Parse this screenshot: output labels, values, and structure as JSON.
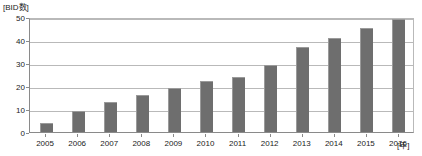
{
  "chart_data": {
    "type": "bar",
    "title": "",
    "subtitle": "",
    "xlabel": "[年]",
    "ylabel": "[BID数]",
    "categories": [
      "2005",
      "2006",
      "2007",
      "2008",
      "2009",
      "2010",
      "2011",
      "2012",
      "2013",
      "2014",
      "2015",
      "2016"
    ],
    "values": [
      4,
      9,
      13,
      16,
      19,
      22,
      24,
      29,
      37,
      41,
      45,
      49
    ],
    "series": [
      {
        "name": "BID数",
        "values": [
          4,
          9,
          13,
          16,
          19,
          22,
          24,
          29,
          37,
          41,
          45,
          49
        ]
      }
    ],
    "ylim": [
      0,
      50
    ],
    "yticks": [
      0,
      10,
      20,
      30,
      40,
      50
    ],
    "ytick_labels": [
      "0",
      "10",
      "20",
      "30",
      "40",
      "50"
    ],
    "grid": true,
    "grid_axis": "y",
    "legend": false,
    "legend_position": "none",
    "bar_color": "#6e6e6e",
    "grid_color": "#b9b9b9",
    "axis_color": "#8a8a8a",
    "background_color": "#ffffff"
  },
  "axes": {
    "y_unit_label": "[BID数]",
    "x_unit_label": "[年]"
  }
}
